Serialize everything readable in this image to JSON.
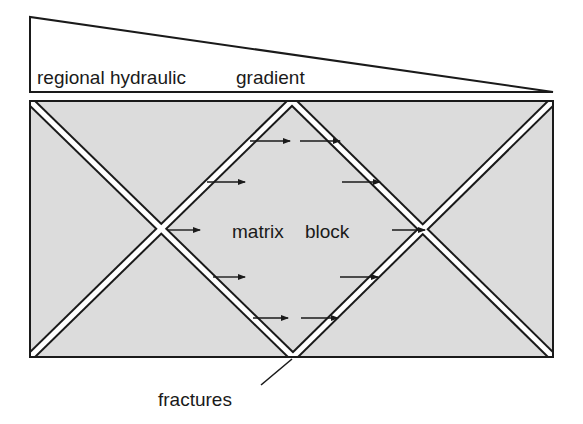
{
  "diagram": {
    "gradient_wedge": {
      "label_left": "regional hydraulic",
      "label_right": "gradient"
    },
    "block": {
      "label_left": "matrix",
      "label_right": "block",
      "fill_color": "#dcdcdc"
    },
    "fractures_label": "fractures",
    "colors": {
      "stroke": "#1a1a1a",
      "fracture_fill": "#ffffff",
      "background": "#ffffff"
    },
    "flow_arrows": [
      {
        "x1": 250,
        "x2": 290,
        "y": 141
      },
      {
        "x1": 300,
        "x2": 340,
        "y": 141
      },
      {
        "x1": 207,
        "x2": 245,
        "y": 182
      },
      {
        "x1": 342,
        "x2": 380,
        "y": 182
      },
      {
        "x1": 168,
        "x2": 200,
        "y": 230
      },
      {
        "x1": 392,
        "x2": 425,
        "y": 230
      },
      {
        "x1": 213,
        "x2": 245,
        "y": 277
      },
      {
        "x1": 340,
        "x2": 378,
        "y": 277
      },
      {
        "x1": 253,
        "x2": 288,
        "y": 318
      },
      {
        "x1": 301,
        "x2": 338,
        "y": 318
      }
    ]
  }
}
